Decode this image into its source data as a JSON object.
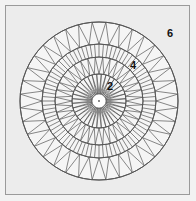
{
  "diagram": {
    "type": "radial-mesh",
    "center": [
      99,
      101
    ],
    "colors": {
      "background": "#ececec",
      "disk": "#f5f5f5",
      "line": "#555555",
      "frame": "#9a9a9a",
      "label": "#111111"
    },
    "rings": [
      {
        "name": "hub",
        "radius": 7
      },
      {
        "name": "inner-zone",
        "inner": 7,
        "outer": 27,
        "spokes": 36,
        "pattern": "zigzag"
      },
      {
        "name": "ring-2",
        "inner": 27,
        "outer": 44,
        "spokes": 36,
        "pattern": "zigzag"
      },
      {
        "name": "dense-band",
        "inner": 44,
        "outer": 57,
        "spokes": 80,
        "pattern": "radial"
      },
      {
        "name": "outer-zone",
        "inner": 57,
        "outer": 79,
        "spokes": 36,
        "pattern": "zigzag"
      }
    ],
    "labels": [
      {
        "text": "6",
        "x": 167,
        "y": 28
      },
      {
        "text": "4",
        "x": 130,
        "y": 60
      },
      {
        "text": "2",
        "x": 107,
        "y": 81
      }
    ]
  }
}
